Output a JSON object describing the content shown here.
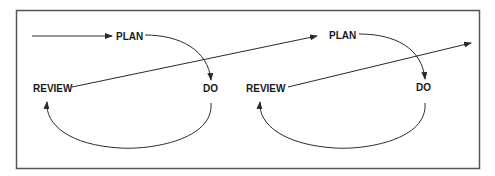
{
  "diagram": {
    "type": "PDCA cycle (two iterations)",
    "colors": {
      "line": "#2a2a2a",
      "frame": "#555555",
      "text": "#1a1a1a",
      "background": "#ffffff"
    },
    "cycles": [
      {
        "plan": "PLAN",
        "do": "DO",
        "review": "REVIEW"
      },
      {
        "plan": "PLAN",
        "do": "DO",
        "review": "REVIEW"
      }
    ],
    "edges": [
      {
        "from": "start",
        "to": "PLAN (cycle 1)"
      },
      {
        "from": "PLAN (cycle 1)",
        "to": "DO (cycle 1)"
      },
      {
        "from": "DO (cycle 1)",
        "to": "REVIEW (cycle 1)"
      },
      {
        "from": "REVIEW (cycle 1)",
        "to": "PLAN (cycle 2)"
      },
      {
        "from": "PLAN (cycle 2)",
        "to": "DO (cycle 2)"
      },
      {
        "from": "DO (cycle 2)",
        "to": "REVIEW (cycle 2)"
      },
      {
        "from": "REVIEW (cycle 2)",
        "to": "continue"
      }
    ]
  }
}
